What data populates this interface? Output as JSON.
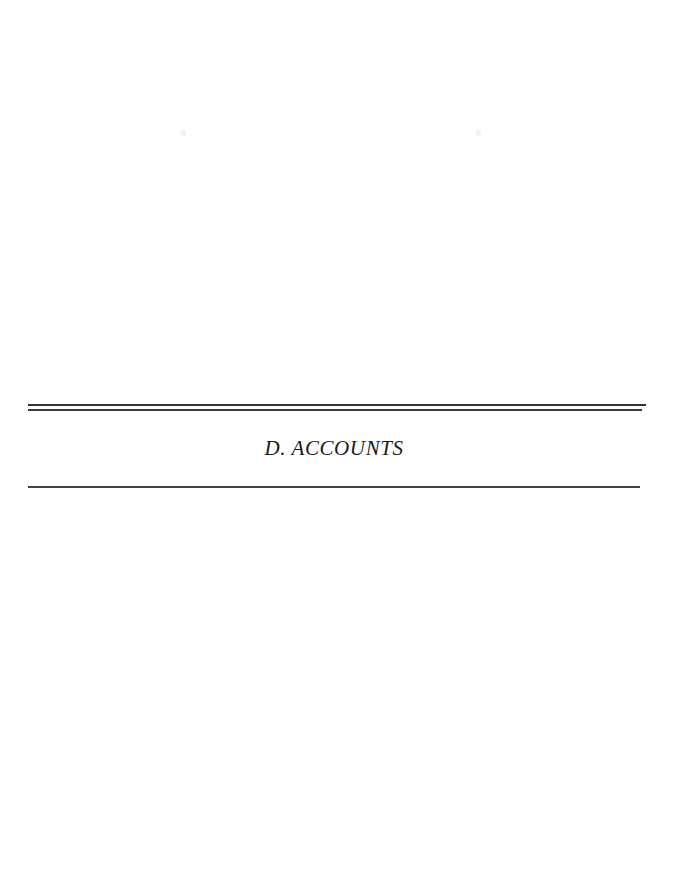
{
  "document": {
    "page_type": "section-divider",
    "background_color": "#ffffff",
    "rule_color": "#333333",
    "text_color": "#1a1a1a"
  },
  "section": {
    "title": "D. ACCOUNTS",
    "letter": "D.",
    "name": "ACCOUNTS"
  },
  "rules": {
    "top_outer": "",
    "top_inner": "",
    "bottom": ""
  },
  "artifacts": {
    "speck_left": "",
    "speck_right": ""
  }
}
